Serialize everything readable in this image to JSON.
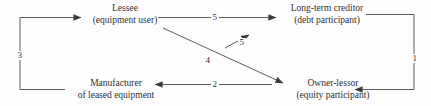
{
  "diagram": {
    "background_color": "#fefefe",
    "line_color": "#4a4a4a",
    "text_color": "#2e2e2e",
    "nodes": [
      {
        "id": "lessee",
        "line1": "Lessee",
        "line2": "(equipment user)"
      },
      {
        "id": "creditor",
        "line1": "Long-term creditor",
        "line2": "(debt participant)"
      },
      {
        "id": "manufacturer",
        "line1": "Manufacturer",
        "line2": "of leased equipment"
      },
      {
        "id": "lessor",
        "line1": "Owner-lessor",
        "line2": "(equity participant)"
      }
    ],
    "edge_labels": {
      "one": "1",
      "two": "2",
      "three": "3",
      "four": "4",
      "five_top": "5",
      "five_diag": "5"
    }
  }
}
